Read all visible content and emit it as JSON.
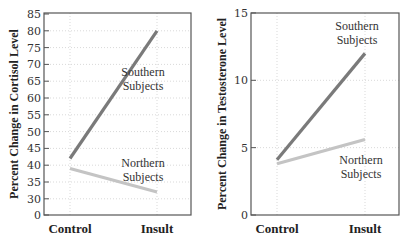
{
  "chart_data": [
    {
      "type": "line",
      "title": "",
      "xlabel": "",
      "ylabel": "Percent Change in Cortisol Level",
      "categories": [
        "Control",
        "Insult"
      ],
      "yticks": [
        "0",
        "30",
        "35",
        "40",
        "45",
        "50",
        "55",
        "60",
        "65",
        "70",
        "75",
        "80",
        "85"
      ],
      "ylim": [
        30,
        85
      ],
      "axis_break": "0 shown at bottom, axis jumps to 30",
      "grid": true,
      "series": [
        {
          "name": "Southern Subjects",
          "values": [
            42,
            80
          ],
          "color": "#7a7a7a"
        },
        {
          "name": "Northern Subjects",
          "values": [
            39,
            32
          ],
          "color": "#c4c4c4"
        }
      ],
      "annotations": [
        {
          "text": "Southern Subjects",
          "lines": [
            "Southern",
            "Subjects"
          ]
        },
        {
          "text": "Northern Subjects",
          "lines": [
            "Northern",
            "Subjects"
          ]
        }
      ]
    },
    {
      "type": "line",
      "title": "",
      "xlabel": "",
      "ylabel": "Percent Change in Testosterone Level",
      "categories": [
        "Control",
        "Insult"
      ],
      "yticks": [
        "0",
        "5",
        "10",
        "15"
      ],
      "ylim": [
        0,
        15
      ],
      "grid": true,
      "series": [
        {
          "name": "Southern Subjects",
          "values": [
            4.1,
            12
          ],
          "color": "#7a7a7a"
        },
        {
          "name": "Northern Subjects",
          "values": [
            3.8,
            5.6
          ],
          "color": "#c4c4c4"
        }
      ],
      "annotations": [
        {
          "text": "Southern Subjects",
          "lines": [
            "Southern",
            "Subjects"
          ]
        },
        {
          "text": "Northern Subjects",
          "lines": [
            "Northern",
            "Subjects"
          ]
        }
      ]
    }
  ]
}
